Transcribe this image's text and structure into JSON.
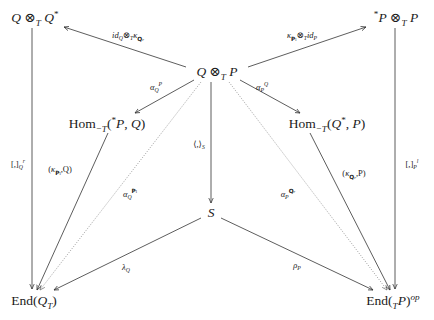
{
  "diagram": {
    "type": "commutative-diagram",
    "nodes": [
      {
        "id": "QxQstar",
        "label": "Q ⊗_T Q*",
        "x": 35,
        "y": 18
      },
      {
        "id": "starPxP",
        "label": "*P ⊗_T P",
        "x": 396,
        "y": 18
      },
      {
        "id": "QxP",
        "label": "Q ⊗_T P",
        "x": 217,
        "y": 72
      },
      {
        "id": "HomLeft",
        "label": "Hom_{-T}(*P, Q)",
        "x": 107,
        "y": 124
      },
      {
        "id": "HomRight",
        "label": "Hom_{-T}(Q*, P)",
        "x": 327,
        "y": 124
      },
      {
        "id": "S",
        "label": "S",
        "x": 211,
        "y": 213
      },
      {
        "id": "EndQ",
        "label": "End(Q_T)",
        "x": 34,
        "y": 301
      },
      {
        "id": "EndP",
        "label": "End(_T P)^op",
        "x": 393,
        "y": 301
      }
    ],
    "edges": [
      {
        "from": "QxP",
        "to": "QxQstar",
        "label": "id_Q ⊗_T κ_{Q_r}",
        "style": "solid"
      },
      {
        "from": "QxP",
        "to": "starPxP",
        "label": "κ_{P_l} ⊗_T id_P",
        "style": "solid"
      },
      {
        "from": "QxP",
        "to": "HomLeft",
        "label": "α_Q^P",
        "style": "solid"
      },
      {
        "from": "QxP",
        "to": "HomRight",
        "label": "α_P^Q",
        "style": "solid"
      },
      {
        "from": "QxP",
        "to": "S",
        "label": "⟨,⟩_S",
        "style": "solid"
      },
      {
        "from": "QxP",
        "to": "EndQ",
        "label": "α_Q^{P_l}",
        "style": "dotted"
      },
      {
        "from": "QxP",
        "to": "EndP",
        "label": "α_P^{Q_r}",
        "style": "dotted"
      },
      {
        "from": "QxQstar",
        "to": "EndQ",
        "label": "[,]_Q^r",
        "style": "solid"
      },
      {
        "from": "starPxP",
        "to": "EndP",
        "label": "[,]_P^l",
        "style": "solid"
      },
      {
        "from": "HomLeft",
        "to": "EndQ",
        "label": "(κ_{P_l}, Q)",
        "style": "solid"
      },
      {
        "from": "HomRight",
        "to": "EndP",
        "label": "(κ_{Q_r}, P)",
        "style": "solid"
      },
      {
        "from": "S",
        "to": "EndQ",
        "label": "λ_Q",
        "style": "solid"
      },
      {
        "from": "S",
        "to": "EndP",
        "label": "ρ_P",
        "style": "solid"
      }
    ]
  },
  "text": {
    "n_QxQstar": {
      "a": "Q",
      "op": " ⊗",
      "sub": "T",
      "b": " Q",
      "sup": "*"
    },
    "n_starPxP": {
      "pre": "*",
      "a": "P",
      "op": " ⊗",
      "sub": "T",
      "b": " P"
    },
    "n_QxP": {
      "a": "Q",
      "op": " ⊗",
      "sub": "T",
      "b": " P"
    },
    "n_HomLeft": {
      "hom": "Hom",
      "sub": "−T",
      "open": "(",
      "pre": "*",
      "a": "P",
      "comma": ", ",
      "b": "Q",
      "close": ")"
    },
    "n_HomRight": {
      "hom": "Hom",
      "sub": "−T",
      "open": "(",
      "a": "Q",
      "sup": "*",
      "comma": ", ",
      "b": "P",
      "close": ")"
    },
    "n_S": {
      "a": "S"
    },
    "n_EndQ": {
      "end": "End",
      "open": "(",
      "a": "Q",
      "sub": "T",
      "close": ")"
    },
    "n_EndP": {
      "end": "End",
      "open": "(",
      "sub": "T",
      "a": "P",
      "close": ")",
      "sup": "op"
    },
    "l_idk": {
      "id": "id",
      "idsub": "Q",
      "op": "⊗",
      "opsub": "T",
      "k": "κ",
      "ksub": "Q",
      "ksubsub": "r"
    },
    "l_kid": {
      "k": "κ",
      "ksub": "P",
      "ksubsub": "l",
      "op": "⊗",
      "opsub": "T",
      "id": "id",
      "idsub": "P"
    },
    "l_aQP": {
      "a": "α",
      "sub": "Q",
      "sup": "P"
    },
    "l_aPQ": {
      "a": "α",
      "sub": "P",
      "sup": "Q"
    },
    "l_pair": {
      "t": "⟨,⟩",
      "sub": "S"
    },
    "l_aQPl": {
      "a": "α",
      "sub": "Q",
      "sup": "P",
      "supsub": "l"
    },
    "l_aPQr": {
      "a": "α",
      "sub": "P",
      "sup": "Q",
      "supsub": "r"
    },
    "l_brQ": {
      "t": "[,]",
      "sub": "Q",
      "sup": "r"
    },
    "l_brP": {
      "t": "[,]",
      "sub": "P",
      "sup": "l"
    },
    "l_kPlQ": {
      "open": "(",
      "k": "κ",
      "ksub": "P",
      "ksubsub": "l",
      "rest": ",Q)"
    },
    "l_kQrP": {
      "open": "(",
      "k": "κ",
      "ksub": "Q",
      "ksubsub": "r",
      "rest": ",P)"
    },
    "l_lambda": {
      "t": "λ",
      "sub": "Q"
    },
    "l_rho": {
      "t": "ρ",
      "sub": "P"
    }
  },
  "colors": {
    "line": "#333333",
    "dotted": "#888888",
    "text": "#1a1a1a"
  }
}
